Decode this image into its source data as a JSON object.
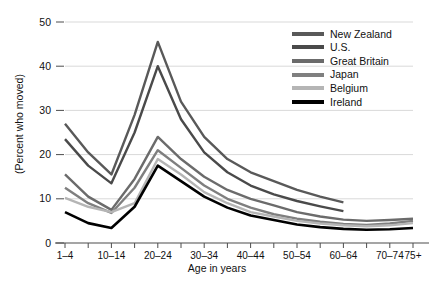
{
  "chart_data": {
    "type": "line",
    "title": "",
    "xlabel": "Age in years",
    "ylabel": "(Percent who moved)",
    "ylim": [
      0,
      50
    ],
    "yticks": [
      0,
      10,
      20,
      30,
      40,
      50
    ],
    "grid": "horizontal",
    "legend_position": "top-right",
    "categories": [
      "1–4",
      "5–9",
      "10–14",
      "15–19",
      "20–24",
      "25–29",
      "30–34",
      "35–39",
      "40–44",
      "45–49",
      "50–54",
      "55–59",
      "60–64",
      "65–69",
      "70–74",
      "75+"
    ],
    "xtick_labels": [
      "1–4",
      "10–14",
      "20–24",
      "30–34",
      "40–44",
      "50–54",
      "60–64",
      "70–74",
      "75+"
    ],
    "xtick_indices": [
      0,
      2,
      4,
      6,
      8,
      10,
      12,
      14,
      15
    ],
    "series": [
      {
        "name": "New Zealand",
        "color": "#595959",
        "values": [
          27.0,
          20.5,
          15.5,
          29.0,
          45.5,
          32.0,
          24.0,
          19.0,
          16.0,
          14.0,
          12.0,
          10.5,
          9.2,
          null,
          null,
          null
        ]
      },
      {
        "name": "U.S.",
        "color": "#4a4a4a",
        "values": [
          23.5,
          17.5,
          13.5,
          25.0,
          40.0,
          28.0,
          20.5,
          16.0,
          13.0,
          11.0,
          9.5,
          8.3,
          7.2,
          null,
          null,
          null
        ]
      },
      {
        "name": "Great Britain",
        "color": "#6b6b6b",
        "values": [
          15.5,
          10.5,
          7.5,
          14.5,
          24.0,
          19.0,
          15.0,
          12.0,
          10.0,
          8.5,
          7.0,
          6.0,
          5.3,
          5.0,
          5.2,
          5.5
        ]
      },
      {
        "name": "Japan",
        "color": "#7f7f7f",
        "values": [
          12.5,
          9.0,
          6.8,
          12.5,
          21.0,
          17.0,
          13.0,
          10.0,
          8.0,
          6.5,
          5.5,
          4.8,
          4.3,
          4.1,
          4.4,
          5.0
        ]
      },
      {
        "name": "Belgium",
        "color": "#b5b5b5",
        "values": [
          10.2,
          8.2,
          7.0,
          9.0,
          19.0,
          15.5,
          11.5,
          9.0,
          7.0,
          6.0,
          5.0,
          4.4,
          4.0,
          3.8,
          4.0,
          4.5
        ]
      },
      {
        "name": "Ireland",
        "color": "#000000",
        "values": [
          7.0,
          4.5,
          3.4,
          8.2,
          17.5,
          14.0,
          10.5,
          8.0,
          6.2,
          5.2,
          4.2,
          3.6,
          3.2,
          3.0,
          3.1,
          3.4
        ]
      }
    ]
  },
  "legend": {
    "items": [
      {
        "label": "New Zealand",
        "color": "#595959"
      },
      {
        "label": "U.S.",
        "color": "#4a4a4a"
      },
      {
        "label": "Great Britain",
        "color": "#6b6b6b"
      },
      {
        "label": "Japan",
        "color": "#7f7f7f"
      },
      {
        "label": "Belgium",
        "color": "#b5b5b5"
      },
      {
        "label": "Ireland",
        "color": "#000000"
      }
    ]
  },
  "axes": {
    "y_label": "(Percent who moved)",
    "x_label": "Age in years",
    "y_ticks": [
      "0",
      "10",
      "20",
      "30",
      "40",
      "50"
    ]
  },
  "colors": {
    "gridline": "#d9d9d9",
    "axis": "#4d4d4d",
    "text": "#111111",
    "background": "#ffffff"
  }
}
